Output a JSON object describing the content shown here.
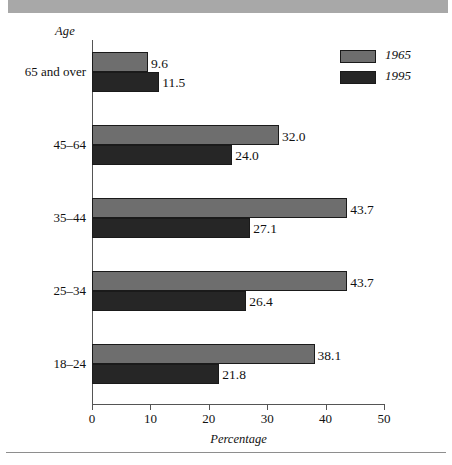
{
  "banner": {
    "color": "#a8a8a8"
  },
  "axes": {
    "y_title": "Age",
    "x_title": "Percentage",
    "x_ticks": [
      "0",
      "10",
      "20",
      "30",
      "40",
      "50"
    ]
  },
  "legend": {
    "items": [
      {
        "label": "1965",
        "color": "#6e6e6e"
      },
      {
        "label": "1995",
        "color": "#262626"
      }
    ]
  },
  "groups": [
    {
      "category": "65 and over",
      "v1965": "9.6",
      "v1995": "11.5"
    },
    {
      "category": "45–64",
      "v1965": "32.0",
      "v1995": "24.0"
    },
    {
      "category": "35–44",
      "v1965": "43.7",
      "v1995": "27.1"
    },
    {
      "category": "25–34",
      "v1965": "43.7",
      "v1995": "26.4"
    },
    {
      "category": "18–24",
      "v1965": "38.1",
      "v1995": "21.8"
    }
  ],
  "chart_data": {
    "type": "bar",
    "orientation": "horizontal",
    "title": "",
    "xlabel": "Percentage",
    "ylabel": "Age",
    "xlim": [
      0,
      50
    ],
    "xticks": [
      0,
      10,
      20,
      30,
      40,
      50
    ],
    "grid": false,
    "legend_position": "top-right",
    "categories": [
      "65 and over",
      "45–64",
      "35–44",
      "25–34",
      "18–24"
    ],
    "series": [
      {
        "name": "1965",
        "color": "#6e6e6e",
        "values": [
          9.6,
          32.0,
          43.7,
          43.7,
          38.1
        ]
      },
      {
        "name": "1995",
        "color": "#262626",
        "values": [
          11.5,
          24.0,
          27.1,
          26.4,
          21.8
        ]
      }
    ],
    "data_labels": [
      {
        "category": "65 and over",
        "1965": "9.6",
        "1995": "11.5"
      },
      {
        "category": "45–64",
        "1965": "32.0",
        "1995": "24.0"
      },
      {
        "category": "35–44",
        "1965": "43.7",
        "1995": "27.1"
      },
      {
        "category": "25–34",
        "1965": "43.7",
        "1995": "26.4"
      },
      {
        "category": "18–24",
        "1965": "38.1",
        "1995": "21.8"
      }
    ]
  }
}
